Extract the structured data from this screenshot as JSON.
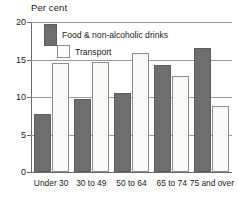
{
  "chart_data": {
    "type": "bar",
    "title": "Per cent",
    "xlabel": "",
    "ylabel": "Per cent",
    "categories": [
      "Under 30",
      "30 to 49",
      "50 to 64",
      "65 to 74",
      "75 and over"
    ],
    "series": [
      {
        "name": "Food & non-alcoholic drinks",
        "color": "#6e6e6e",
        "values": [
          7.7,
          9.8,
          10.6,
          14.3,
          16.5
        ]
      },
      {
        "name": "Transport",
        "color": "#f8f8f6",
        "values": [
          14.6,
          14.7,
          15.9,
          12.8,
          8.8
        ]
      }
    ],
    "ylim": [
      0,
      20
    ],
    "yticks": [
      0,
      5,
      10,
      15,
      20
    ],
    "ytick_labels": [
      "0",
      "5",
      "10",
      "15",
      "20"
    ],
    "grid": true,
    "legend_position": "top-left-inside"
  }
}
